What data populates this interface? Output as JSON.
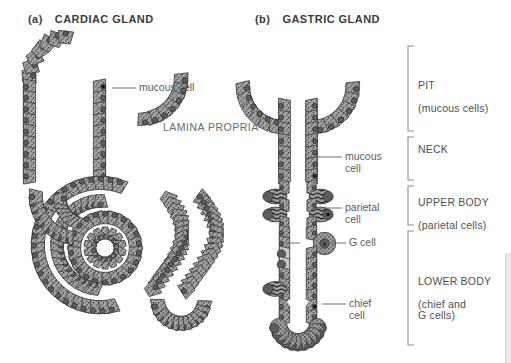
{
  "figure": {
    "panel_a": {
      "prefix": "(a)",
      "title": "CARDIAC GLAND"
    },
    "panel_b": {
      "prefix": "(b)",
      "title": "GASTRIC GLAND"
    },
    "lamina_label": "LAMINA PROPRIA"
  },
  "callouts": {
    "a_mucous": "mucous cell",
    "b_mucous": "mucous\ncell",
    "b_parietal": "parietal\ncell",
    "b_gcell": "G cell",
    "b_chief": "chief\ncell"
  },
  "regions": [
    {
      "name": "PIT",
      "sub": "(mucous cells)"
    },
    {
      "name": "NECK",
      "sub": ""
    },
    {
      "name": "UPPER BODY",
      "sub": "(parietal cells)"
    },
    {
      "name": "LOWER BODY",
      "sub": "(chief and\nG cells)"
    }
  ],
  "colors": {
    "cell_fill": "#9a9a9a",
    "cell_outline": "#3d3d3d",
    "nucleus": "#5d5d5d",
    "nucleus_outline": "#2f2f2f",
    "stipple": "#2b2b2b",
    "lumen": "#ffffff",
    "pale_cell": "#c9c9c9",
    "text": "#4a4a4a",
    "bracket": "#8a8a8a"
  }
}
